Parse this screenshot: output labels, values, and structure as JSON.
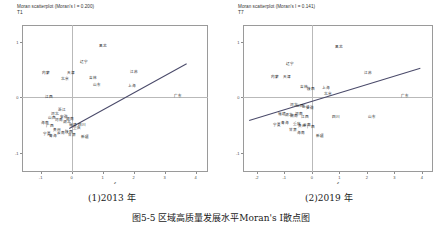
{
  "figure": {
    "caption": "图5-5  区域高质量发展水平Moran's I散点图",
    "sub_captions": [
      {
        "label": "(1)2013 年",
        "x": 88
      },
      {
        "label": "(2)2019 年",
        "x": 305
      }
    ]
  },
  "chart_data": [
    {
      "type": "scatter",
      "title": "Moran scatterplot (Moran's I = 0.200)",
      "subtitle": "T1",
      "morans_i": 0.2,
      "xlabel": "z",
      "ylabel": "",
      "xlim": [
        -1.6,
        4.4
      ],
      "ylim": [
        -1.35,
        1.3
      ],
      "xticks": [
        -1,
        0,
        1,
        2,
        3,
        4
      ],
      "yticks": [
        1,
        0,
        -1
      ],
      "grid": false,
      "reference_lines": {
        "vertical_x": 0,
        "horizontal_y": 0
      },
      "fit_line": {
        "x0": -0.1,
        "y0": -0.55,
        "x1": 3.7,
        "y1": 0.62
      },
      "points": [
        {
          "label": "黑龙",
          "x": 1.02,
          "y": 0.92
        },
        {
          "label": "辽宁",
          "x": 0.4,
          "y": 0.63
        },
        {
          "label": "内蒙",
          "x": -0.82,
          "y": 0.44
        },
        {
          "label": "天津",
          "x": -0.03,
          "y": 0.44
        },
        {
          "label": "江苏",
          "x": 2.0,
          "y": 0.45
        },
        {
          "label": "北京",
          "x": -0.22,
          "y": 0.33
        },
        {
          "label": "吉林",
          "x": 0.68,
          "y": 0.34
        },
        {
          "label": "山东",
          "x": 0.82,
          "y": 0.22
        },
        {
          "label": "上海",
          "x": 1.95,
          "y": 0.2
        },
        {
          "label": "江西",
          "x": -0.74,
          "y": 0.0
        },
        {
          "label": "广东",
          "x": 3.42,
          "y": 0.02
        },
        {
          "label": "浙江",
          "x": -0.3,
          "y": -0.23
        },
        {
          "label": "河北",
          "x": -0.52,
          "y": -0.3
        },
        {
          "label": "山西",
          "x": -0.62,
          "y": -0.37
        },
        {
          "label": "河南",
          "x": -0.4,
          "y": -0.42
        },
        {
          "label": "安徽",
          "x": -0.26,
          "y": -0.36
        },
        {
          "label": "湖北",
          "x": -0.16,
          "y": -0.45
        },
        {
          "label": "湖南",
          "x": -0.06,
          "y": -0.4
        },
        {
          "label": "福建",
          "x": 0.06,
          "y": -0.5
        },
        {
          "label": "广西",
          "x": -0.7,
          "y": -0.52
        },
        {
          "label": "海南",
          "x": -0.86,
          "y": -0.46
        },
        {
          "label": "重庆",
          "x": 0.18,
          "y": -0.56
        },
        {
          "label": "四川",
          "x": 0.32,
          "y": -0.5
        },
        {
          "label": "贵州",
          "x": -0.48,
          "y": -0.6
        },
        {
          "label": "云南",
          "x": -0.34,
          "y": -0.64
        },
        {
          "label": "陕西",
          "x": -0.1,
          "y": -0.62
        },
        {
          "label": "甘肃",
          "x": 0.02,
          "y": -0.68
        },
        {
          "label": "青海",
          "x": -0.6,
          "y": -0.7
        },
        {
          "label": "宁夏",
          "x": -0.78,
          "y": -0.66
        },
        {
          "label": "新疆",
          "x": 0.44,
          "y": -0.72
        }
      ]
    },
    {
      "type": "scatter",
      "title": "Moran scatterplot (Moran's I = 0.141)",
      "subtitle": "T7",
      "morans_i": 0.141,
      "xlabel": "z",
      "ylabel": "",
      "xlim": [
        -2.5,
        4.4
      ],
      "ylim": [
        -1.35,
        1.3
      ],
      "xticks": [
        -2,
        -1,
        0,
        1,
        2,
        3,
        4
      ],
      "yticks": [
        1,
        0,
        -1
      ],
      "grid": false,
      "reference_lines": {
        "vertical_x": 0,
        "horizontal_y": 0
      },
      "fit_line": {
        "x0": -2.3,
        "y0": -0.42,
        "x1": 3.9,
        "y1": 0.52
      },
      "points": [
        {
          "label": "黑龙",
          "x": 1.0,
          "y": 0.9
        },
        {
          "label": "辽宁",
          "x": -0.78,
          "y": 0.6
        },
        {
          "label": "江苏",
          "x": 2.05,
          "y": 0.44
        },
        {
          "label": "内蒙",
          "x": -1.35,
          "y": 0.36
        },
        {
          "label": "天津",
          "x": -0.9,
          "y": 0.36
        },
        {
          "label": "吉林",
          "x": -0.3,
          "y": 0.18
        },
        {
          "label": "上海",
          "x": 0.52,
          "y": 0.16
        },
        {
          "label": "陕西",
          "x": -0.04,
          "y": 0.14
        },
        {
          "label": "北京",
          "x": 0.6,
          "y": 0.06
        },
        {
          "label": "广东",
          "x": 3.4,
          "y": 0.02
        },
        {
          "label": "河北",
          "x": -0.66,
          "y": -0.14
        },
        {
          "label": "山西",
          "x": -0.42,
          "y": -0.16
        },
        {
          "label": "浙江",
          "x": -0.2,
          "y": -0.18
        },
        {
          "label": "安徽",
          "x": -0.06,
          "y": -0.2
        },
        {
          "label": "福建",
          "x": -1.1,
          "y": -0.3
        },
        {
          "label": "湖北",
          "x": -0.84,
          "y": -0.32
        },
        {
          "label": "湖南",
          "x": -0.64,
          "y": -0.34
        },
        {
          "label": "河南",
          "x": -0.46,
          "y": -0.3
        },
        {
          "label": "江西",
          "x": -0.26,
          "y": -0.36
        },
        {
          "label": "四川",
          "x": 0.88,
          "y": -0.36
        },
        {
          "label": "山东",
          "x": 2.2,
          "y": -0.36
        },
        {
          "label": "宁夏",
          "x": -1.26,
          "y": -0.5
        },
        {
          "label": "青海",
          "x": -0.96,
          "y": -0.46
        },
        {
          "label": "重庆",
          "x": -0.54,
          "y": -0.48
        },
        {
          "label": "贵州",
          "x": -0.36,
          "y": -0.52
        },
        {
          "label": "云南",
          "x": -0.18,
          "y": -0.5
        },
        {
          "label": "广西",
          "x": -0.02,
          "y": -0.54
        },
        {
          "label": "甘肃",
          "x": -0.7,
          "y": -0.6
        },
        {
          "label": "海南",
          "x": -0.4,
          "y": -0.64
        },
        {
          "label": "新疆",
          "x": 0.3,
          "y": -0.7
        }
      ]
    }
  ]
}
